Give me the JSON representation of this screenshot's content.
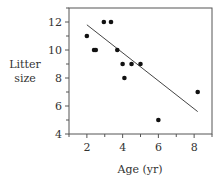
{
  "chart_data": {
    "type": "scatter",
    "title": "",
    "xlabel": "Age (yr)",
    "ylabel": "Litter size",
    "ylabel_lines": [
      "Litter",
      "size"
    ],
    "xlim": [
      1,
      9
    ],
    "ylim": [
      4,
      13
    ],
    "xticks": [
      2,
      4,
      6,
      8
    ],
    "yticks": [
      4,
      6,
      8,
      10,
      12
    ],
    "grid": false,
    "legend": null,
    "points": [
      {
        "x": 2.0,
        "y": 11
      },
      {
        "x": 2.4,
        "y": 10
      },
      {
        "x": 2.5,
        "y": 10
      },
      {
        "x": 2.95,
        "y": 12
      },
      {
        "x": 3.35,
        "y": 12
      },
      {
        "x": 3.7,
        "y": 10
      },
      {
        "x": 4.0,
        "y": 9
      },
      {
        "x": 4.1,
        "y": 8
      },
      {
        "x": 4.5,
        "y": 9
      },
      {
        "x": 5.0,
        "y": 9
      },
      {
        "x": 6.0,
        "y": 5
      },
      {
        "x": 8.2,
        "y": 7
      }
    ],
    "fit_line": {
      "x1": 2.0,
      "y1": 11.8,
      "x2": 8.2,
      "y2": 5.6
    }
  }
}
